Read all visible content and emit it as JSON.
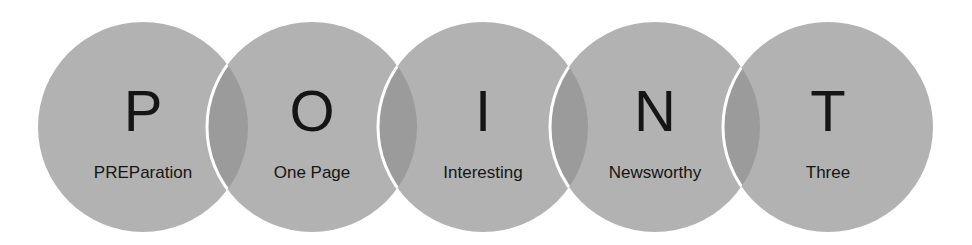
{
  "diagram": {
    "type": "overlapping-circles",
    "acronym": "POINT",
    "colors": {
      "circle": "#b2b2b2",
      "overlap": "#9a9a9a",
      "border": "#ffffff",
      "text": "#151515"
    },
    "items": [
      {
        "letter": "P",
        "word": "PREParation",
        "x": 38
      },
      {
        "letter": "O",
        "word": "One Page",
        "x": 207
      },
      {
        "letter": "I",
        "word": "Interesting",
        "x": 378
      },
      {
        "letter": "N",
        "word": "Newsworthy",
        "x": 550
      },
      {
        "letter": "T",
        "word": "Three",
        "x": 723
      }
    ]
  }
}
